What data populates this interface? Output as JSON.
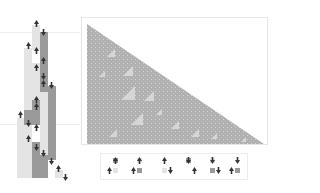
{
  "figure": {
    "colors": {
      "background": "#ffffff",
      "cell_light": "#e4e4e4",
      "cell_dark": "#9a9a9a",
      "head": "#333333",
      "evolution_fill": "#b0b0b0",
      "evolution_light": "#d6d6d6",
      "frame_border": "#e6e6e6"
    }
  },
  "tape_diagram": {
    "label": "head-movement tape history",
    "columns": [
      {
        "x": 17,
        "cells": [
          {
            "y0": 118,
            "y1": 178,
            "shade": "light"
          }
        ]
      },
      {
        "x": 24,
        "cells": [
          {
            "y0": 48,
            "y1": 178,
            "shade": "light"
          },
          {
            "y0": 110,
            "y1": 125,
            "shade": "dark"
          }
        ]
      },
      {
        "x": 32,
        "cells": [
          {
            "y0": 25,
            "y1": 50,
            "shade": "light"
          },
          {
            "y0": 50,
            "y1": 63,
            "shade": "white"
          },
          {
            "y0": 63,
            "y1": 100,
            "shade": "light"
          },
          {
            "y0": 100,
            "y1": 130,
            "shade": "dark"
          },
          {
            "y0": 125,
            "y1": 142,
            "shade": "white"
          },
          {
            "y0": 142,
            "y1": 178,
            "shade": "dark"
          }
        ]
      },
      {
        "x": 40,
        "cells": [
          {
            "y0": 32,
            "y1": 78,
            "shade": "dark"
          },
          {
            "y0": 78,
            "y1": 92,
            "shade": "dark"
          },
          {
            "y0": 92,
            "y1": 155,
            "shade": "light"
          },
          {
            "y0": 155,
            "y1": 178,
            "shade": "dark"
          }
        ]
      },
      {
        "x": 48,
        "cells": [
          {
            "y0": 86,
            "y1": 160,
            "shade": "dark"
          }
        ]
      },
      {
        "x": 55,
        "cells": [
          {
            "y0": 170,
            "y1": 178,
            "shade": "light"
          }
        ]
      }
    ],
    "heads": [
      {
        "x": 36,
        "y": 20,
        "dir": "up"
      },
      {
        "x": 43,
        "y": 29,
        "dir": "down"
      },
      {
        "x": 28,
        "y": 42,
        "dir": "up"
      },
      {
        "x": 36,
        "y": 47,
        "dir": "up"
      },
      {
        "x": 43,
        "y": 57,
        "dir": "up"
      },
      {
        "x": 36,
        "y": 64,
        "dir": "up"
      },
      {
        "x": 43,
        "y": 73,
        "dir": "down"
      },
      {
        "x": 43,
        "y": 80,
        "dir": "up"
      },
      {
        "x": 51,
        "y": 82,
        "dir": "down"
      },
      {
        "x": 36,
        "y": 96,
        "dir": "up"
      },
      {
        "x": 36,
        "y": 103,
        "dir": "up"
      },
      {
        "x": 20,
        "y": 111,
        "dir": "up"
      },
      {
        "x": 28,
        "y": 120,
        "dir": "down"
      },
      {
        "x": 36,
        "y": 124,
        "dir": "up"
      },
      {
        "x": 28,
        "y": 135,
        "dir": "up"
      },
      {
        "x": 36,
        "y": 144,
        "dir": "down"
      },
      {
        "x": 43,
        "y": 150,
        "dir": "down"
      },
      {
        "x": 51,
        "y": 158,
        "dir": "down"
      },
      {
        "x": 58,
        "y": 165,
        "dir": "up"
      },
      {
        "x": 65,
        "y": 174,
        "dir": "down"
      }
    ],
    "guide_lines_y": [
      32,
      124
    ]
  },
  "evolution_panel": {
    "label": "compressed evolution (triangular growth)",
    "shape": "right-triangle",
    "apex": {
      "x": 86,
      "y": 23
    },
    "bottom_left": {
      "x": 86,
      "y": 143
    },
    "bottom_right": {
      "x": 263,
      "y": 143
    },
    "nested_triangles": [
      {
        "x": 106,
        "y": 48,
        "s": 8
      },
      {
        "x": 122,
        "y": 65,
        "s": 10
      },
      {
        "x": 120,
        "y": 85,
        "s": 14
      },
      {
        "x": 143,
        "y": 90,
        "s": 10
      },
      {
        "x": 130,
        "y": 112,
        "s": 12
      },
      {
        "x": 108,
        "y": 128,
        "s": 8
      },
      {
        "x": 170,
        "y": 120,
        "s": 8
      },
      {
        "x": 190,
        "y": 128,
        "s": 8
      },
      {
        "x": 98,
        "y": 70,
        "s": 6
      },
      {
        "x": 155,
        "y": 108,
        "s": 6
      },
      {
        "x": 210,
        "y": 132,
        "s": 6
      },
      {
        "x": 240,
        "y": 136,
        "s": 5
      }
    ]
  },
  "rules": [
    {
      "id": 1,
      "state_in": "dark",
      "cell_in": "dark",
      "head_in": "up",
      "cell_out": "light",
      "move": "left",
      "head_out": "up"
    },
    {
      "id": 2,
      "state_in": "dark",
      "cell_in": "light",
      "head_in": "up",
      "cell_out": "dark",
      "move": "left",
      "head_out": "up"
    },
    {
      "id": 3,
      "state_in": "up",
      "cell_in": "white",
      "head_in": "up",
      "cell_out": "light",
      "move": "right",
      "head_out": "down"
    },
    {
      "id": 4,
      "state_in": "dark",
      "cell_in": "dark",
      "head_in": "down",
      "cell_out": "white",
      "move": "right",
      "head_out": "up"
    },
    {
      "id": 5,
      "state_in": "down",
      "cell_in": "light",
      "head_in": "down",
      "cell_out": "dark",
      "move": "right",
      "head_out": "down"
    },
    {
      "id": 6,
      "state_in": "down",
      "cell_in": "white",
      "head_in": "down",
      "cell_out": "dark",
      "move": "left",
      "head_out": "up"
    }
  ]
}
